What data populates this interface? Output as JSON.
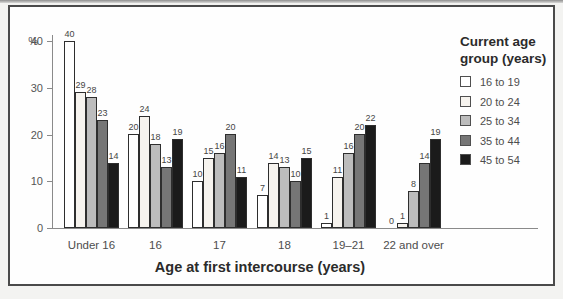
{
  "figure": {
    "page_background": "#f3f3f1",
    "frame_background": "#fefefe",
    "frame_border_color": "#4a4a4a",
    "axis_color": "#8a8a8a",
    "bar_border_color": "#2e2e2e",
    "text_color": "#4d4d4d"
  },
  "chart_data": {
    "type": "bar",
    "title": "",
    "xlabel": "Age at first intercourse (years)",
    "ylabel": "%",
    "ylim": [
      0,
      40
    ],
    "yticks": [
      0,
      10,
      20,
      30,
      40
    ],
    "grid": false,
    "bar_value_labels": true,
    "categories": [
      "Under 16",
      "16",
      "17",
      "18",
      "19–21",
      "22 and over"
    ],
    "legend": {
      "title_lines": [
        "Current age",
        "group (years)"
      ],
      "position": "right"
    },
    "series": [
      {
        "name": "16 to 19",
        "color": "#ffffff",
        "values": [
          40,
          20,
          10,
          7,
          1,
          0
        ]
      },
      {
        "name": "20 to 24",
        "color": "#f6f3ee",
        "values": [
          29,
          24,
          15,
          14,
          11,
          1
        ]
      },
      {
        "name": "25 to 34",
        "color": "#bcbcbc",
        "values": [
          28,
          18,
          16,
          13,
          16,
          8
        ]
      },
      {
        "name": "35 to 44",
        "color": "#767676",
        "values": [
          23,
          13,
          20,
          10,
          20,
          14
        ]
      },
      {
        "name": "45 to 54",
        "color": "#1b1b1b",
        "values": [
          14,
          19,
          11,
          15,
          22,
          19
        ]
      }
    ]
  }
}
